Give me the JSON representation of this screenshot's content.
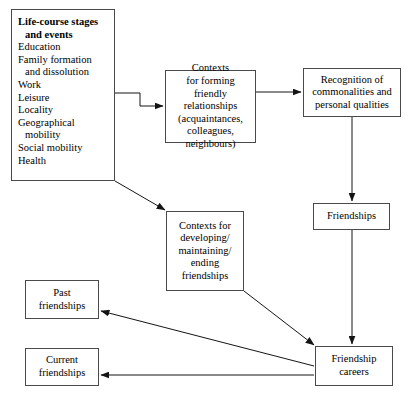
{
  "diagram": {
    "stroke_color": "#4a4a4a",
    "background_color": "#ffffff",
    "text_color": "#000000",
    "nodes": {
      "life_course": {
        "name": "Life-course stages and events",
        "lines": [
          "Life-course stages",
          "and events",
          "Education",
          "Family formation",
          "and dissolution",
          "Work",
          "Leisure",
          "Locality",
          "Geographical",
          "mobility",
          "Social mobility",
          "Health"
        ]
      },
      "contexts_forming": {
        "name": "Contexts for forming friendly relationships",
        "lines": [
          "Contexts",
          "for forming",
          "friendly",
          "relationships",
          "(acquaintances,",
          "colleagues,",
          "neighbours)"
        ]
      },
      "recognition": {
        "name": "Recognition of commonalities and personal qualities",
        "lines": [
          "Recognition of",
          "commonalities and",
          "personal qualities"
        ]
      },
      "friendships": {
        "name": "Friendships",
        "lines": [
          "Friendships"
        ]
      },
      "contexts_developing": {
        "name": "Contexts for developing/maintaining/ending friendships",
        "lines": [
          "Contexts for",
          "developing/",
          "maintaining/",
          "ending",
          "friendships"
        ]
      },
      "past_friendships": {
        "name": "Past friendships",
        "lines": [
          "Past",
          "friendships"
        ]
      },
      "current_friendships": {
        "name": "Current friendships",
        "lines": [
          "Current",
          "friendships"
        ]
      },
      "friendship_careers": {
        "name": "Friendship careers",
        "lines": [
          "Friendship",
          "careers"
        ]
      }
    },
    "edges": [
      {
        "from": "life_course",
        "to": "contexts_forming",
        "style": "elbow-right"
      },
      {
        "from": "contexts_forming",
        "to": "recognition",
        "style": "horizontal"
      },
      {
        "from": "recognition",
        "to": "friendships",
        "style": "vertical"
      },
      {
        "from": "friendships",
        "to": "friendship_careers",
        "style": "vertical"
      },
      {
        "from": "life_course",
        "to": "contexts_developing",
        "style": "diagonal"
      },
      {
        "from": "contexts_developing",
        "to": "friendship_careers",
        "style": "diagonal"
      },
      {
        "from": "friendship_careers",
        "to": "past_friendships",
        "style": "diagonal"
      },
      {
        "from": "friendship_careers",
        "to": "current_friendships",
        "style": "horizontal"
      }
    ]
  }
}
